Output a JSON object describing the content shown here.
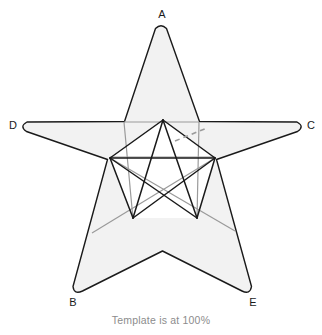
{
  "figure": {
    "title_caption": "Template is at 100%",
    "colors": {
      "background": "#ffffff",
      "star_fill": "#f2f2f2",
      "star_stroke": "#1a1a1a",
      "inner_dark_line": "#1a1a1a",
      "inner_grey_line": "#9a9a9a",
      "dashed_line": "#9a9a9a",
      "label_text": "#1a1a1a",
      "caption_text": "#8c8c8c",
      "inner_pentagon_fill": "#ffffff"
    },
    "labels": [
      {
        "id": "A",
        "text": "A",
        "position": "top",
        "x": 162,
        "y": 18
      },
      {
        "id": "B",
        "text": "B",
        "position": "bottom-left",
        "x": 73,
        "y": 305
      },
      {
        "id": "C",
        "text": "C",
        "position": "right",
        "x": 311,
        "y": 129
      },
      {
        "id": "D",
        "text": "D",
        "position": "left",
        "x": 13,
        "y": 129
      },
      {
        "id": "E",
        "text": "E",
        "position": "bottom-right",
        "x": 253,
        "y": 305
      }
    ],
    "star": {
      "shape": "five-pointed-star",
      "tips_rounded": true,
      "outer_points": [
        {
          "label": "A",
          "x": 161,
          "y": 26
        },
        {
          "label": "C",
          "x": 303,
          "y": 126
        },
        {
          "label": "E",
          "x": 248,
          "y": 294
        },
        {
          "label": "B",
          "x": 76,
          "y": 294
        },
        {
          "label": "D",
          "x": 21,
          "y": 126
        }
      ],
      "inner_points": [
        {
          "x": 198,
          "y": 120
        },
        {
          "x": 215,
          "y": 218
        },
        {
          "x": 161,
          "y": 252
        },
        {
          "x": 108,
          "y": 218
        },
        {
          "x": 125,
          "y": 120
        }
      ]
    },
    "construction": {
      "dark_segments": [
        {
          "name": "pentagon-top-right-edge",
          "x1": 163,
          "y1": 120,
          "x2": 215,
          "y2": 158
        },
        {
          "name": "pentagon-right-edge",
          "x1": 215,
          "y1": 158,
          "x2": 197,
          "y2": 218
        },
        {
          "name": "pentagon-bottom-edge",
          "x1": 197,
          "y1": 218,
          "x2": 133,
          "y2": 218
        },
        {
          "name": "pentagon-left-edge",
          "x1": 133,
          "y1": 218,
          "x2": 110,
          "y2": 158
        },
        {
          "name": "diagonal-left-apex",
          "x1": 110,
          "y1": 158,
          "x2": 163,
          "y2": 120
        },
        {
          "name": "chord-left-to-bottom-right",
          "x1": 110,
          "y1": 158,
          "x2": 197,
          "y2": 218
        },
        {
          "name": "chord-right-to-bottom-left",
          "x1": 215,
          "y1": 158,
          "x2": 133,
          "y2": 218
        },
        {
          "name": "horizontal-chord",
          "x1": 110,
          "y1": 158,
          "x2": 215,
          "y2": 158
        },
        {
          "name": "apex-left-leg",
          "x1": 163,
          "y1": 120,
          "x2": 133,
          "y2": 218
        },
        {
          "name": "apex-right-leg",
          "x1": 163,
          "y1": 120,
          "x2": 197,
          "y2": 218
        }
      ],
      "grey_segments": [
        {
          "name": "grey-horizontal-chord",
          "x1": 110,
          "y1": 157,
          "x2": 215,
          "y2": 157
        },
        {
          "name": "grey-left-diagonal",
          "x1": 124,
          "y1": 122,
          "x2": 133,
          "y2": 219
        },
        {
          "name": "grey-right-diagonal",
          "x1": 199,
          "y1": 122,
          "x2": 197,
          "y2": 219
        },
        {
          "name": "grey-lower-left-cross",
          "x1": 110,
          "y1": 158,
          "x2": 235,
          "y2": 230
        },
        {
          "name": "grey-lower-right-cross",
          "x1": 215,
          "y1": 158,
          "x2": 92,
          "y2": 232
        },
        {
          "name": "grey-top-chord",
          "x1": 124,
          "y1": 122,
          "x2": 199,
          "y2": 122
        }
      ],
      "dashed_segments": [
        {
          "name": "dashed-measure-line",
          "x1": 175,
          "y1": 141,
          "x2": 207,
          "y2": 128,
          "dash": "5 4"
        }
      ]
    }
  }
}
